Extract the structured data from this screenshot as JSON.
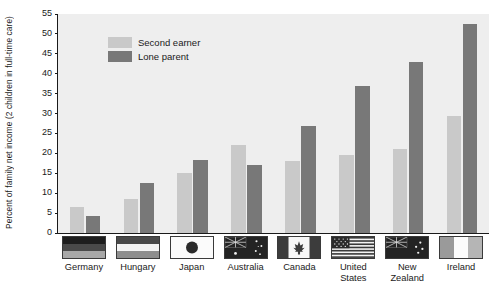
{
  "chart_data": {
    "type": "bar",
    "title": "",
    "xlabel": "",
    "ylabel": "Percent of family net income (2 children in full-time care)",
    "ylim": [
      0,
      55
    ],
    "yticks": [
      0,
      5,
      10,
      15,
      20,
      25,
      30,
      35,
      40,
      45,
      50,
      55
    ],
    "grid": false,
    "legend_position": "upper-left-inside",
    "categories": [
      "Germany",
      "Hungary",
      "Japan",
      "Australia",
      "Canada",
      "United\nStates",
      "New\nZealand",
      "Ireland"
    ],
    "category_flags": [
      "flag-germany",
      "flag-hungary",
      "flag-japan",
      "flag-australia",
      "flag-canada",
      "flag-united-states",
      "flag-new-zealand",
      "flag-ireland"
    ],
    "series": [
      {
        "name": "Second earner",
        "color": "#c9c9c9",
        "values": [
          6.5,
          8.5,
          15.0,
          22.0,
          18.0,
          19.7,
          21.0,
          29.5
        ]
      },
      {
        "name": "Lone parent",
        "color": "#787878",
        "values": [
          4.3,
          12.5,
          18.3,
          17.0,
          27.0,
          37.0,
          43.0,
          52.5
        ]
      }
    ]
  },
  "colors": {
    "plot_background": "#eeeeee",
    "axis": "#1a1a1a",
    "second_earner": "#c9c9c9",
    "lone_parent": "#787878"
  }
}
